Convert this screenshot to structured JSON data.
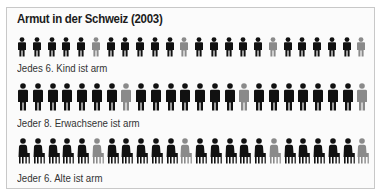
{
  "chart_data": {
    "type": "pictogram",
    "title": "Armut in der Schweiz (2003)",
    "colors": {
      "normal": "#111111",
      "poor": "#8a8a8a"
    },
    "rows": [
      {
        "group": "Kinder",
        "caption": "Jedes 6. Kind ist arm",
        "ratio": "1 in 6",
        "count": 24,
        "highlight_every": 6,
        "icon": "child-figure"
      },
      {
        "group": "Erwachsene",
        "caption": "Jeder 8. Erwachsene ist arm",
        "ratio": "1 in 8",
        "count": 24,
        "highlight_every": 8,
        "icon": "adult-figure"
      },
      {
        "group": "Alte",
        "caption": "Jeder 6. Alte ist arm",
        "ratio": "1 in 6",
        "count": 24,
        "highlight_every": 6,
        "icon": "seated-elderly-figure"
      }
    ]
  },
  "title": "Armut in der Schweiz (2003)",
  "captions": {
    "kids": "Jedes 6. Kind ist arm",
    "adults": "Jeder 8. Erwachsene ist arm",
    "elderly": "Jeder 6. Alte ist arm"
  }
}
